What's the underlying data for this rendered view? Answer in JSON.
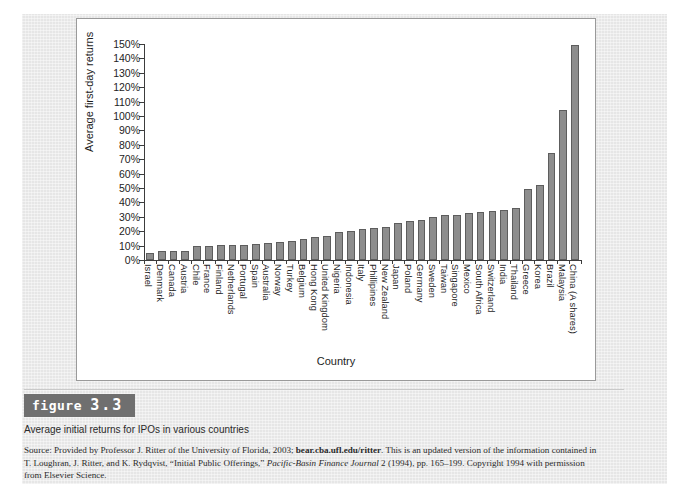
{
  "figure": {
    "badge_word": "figure",
    "badge_number": "3.3",
    "title": "Average initial returns for IPOs in various countries",
    "source_prefix": "Source: Provided by Professor J. Ritter of the University of Florida, 2003; ",
    "source_url": "bear.cba.ufl.edu/ritter",
    "source_mid": ". This is an updated version of the information contained in T. Loughran, J. Ritter, and K. Rydqvist, “Initial Public Offerings,” ",
    "source_journal": "Pacific-Basin Finance Journal",
    "source_tail": " 2 (1994), pp. 165–199. Copyright 1994 with permission from Elsevier Science."
  },
  "chart_data": {
    "type": "bar",
    "title": "Average initial returns for IPOs in various countries",
    "xlabel": "Country",
    "ylabel": "Average first-day returns",
    "ylim": [
      0,
      150
    ],
    "ytick_labels": [
      "0%",
      "10%",
      "20%",
      "30%",
      "40%",
      "50%",
      "60%",
      "70%",
      "80%",
      "90%",
      "100%",
      "110%",
      "120%",
      "130%",
      "140%",
      "150%"
    ],
    "ytick_values": [
      0,
      10,
      20,
      30,
      40,
      50,
      60,
      70,
      80,
      90,
      100,
      110,
      120,
      130,
      140,
      150
    ],
    "grid": false,
    "legend": "none",
    "bar_color": "#8d8d8d",
    "bar_edge_color": "#5d5d5d",
    "categories": [
      "Israel",
      "Denmark",
      "Canada",
      "Austria",
      "Chile",
      "France",
      "Finland",
      "Netherlands",
      "Portugal",
      "Spain",
      "Australia",
      "Norway",
      "Turkey",
      "Belgium",
      "Hong Kong",
      "United Kingdom",
      "Nigeria",
      "Indonesia",
      "Italy",
      "Phillipines",
      "New Zealand",
      "Japan",
      "Poland",
      "Germany",
      "Sweden",
      "Taiwan",
      "Singapore",
      "Mexico",
      "South Africa",
      "Switzerland",
      "India",
      "Thailand",
      "Greece",
      "Korea",
      "Brazil",
      "Malaysia",
      "China (A shares)"
    ],
    "values": [
      5,
      6,
      6.5,
      6.5,
      9.5,
      10,
      10.5,
      10.5,
      10.5,
      11,
      12,
      12.5,
      13.5,
      14.5,
      16,
      17,
      19.5,
      20,
      21.5,
      22,
      23,
      26,
      27,
      28,
      30,
      31,
      31.5,
      32.5,
      33,
      34,
      35,
      36,
      49,
      52,
      74,
      104,
      149
    ]
  }
}
